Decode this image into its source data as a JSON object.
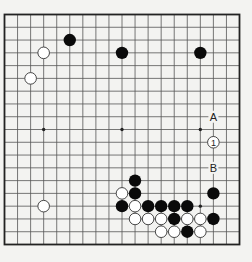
{
  "diagram": {
    "type": "go-board",
    "size": 19,
    "colors": {
      "background": "#f3f3f1",
      "line": "#555555",
      "border": "#222222",
      "black": "#0a0a0a",
      "white": "#ffffff",
      "white_outline": "#333333",
      "label": "#222222"
    },
    "star_points": [
      [
        3,
        9
      ],
      [
        9,
        9
      ],
      [
        15,
        9
      ],
      [
        15,
        15
      ]
    ],
    "stones": [
      {
        "color": "black",
        "col": 5,
        "row": 2
      },
      {
        "color": "white",
        "col": 3,
        "row": 3
      },
      {
        "color": "black",
        "col": 9,
        "row": 3
      },
      {
        "color": "black",
        "col": 15,
        "row": 3
      },
      {
        "color": "white",
        "col": 2,
        "row": 5
      },
      {
        "color": "white",
        "col": 3,
        "row": 15
      },
      {
        "color": "black",
        "col": 10,
        "row": 13
      },
      {
        "color": "white",
        "col": 9,
        "row": 14
      },
      {
        "color": "black",
        "col": 10,
        "row": 14
      },
      {
        "color": "black",
        "col": 16,
        "row": 14
      },
      {
        "color": "black",
        "col": 9,
        "row": 15
      },
      {
        "color": "white",
        "col": 10,
        "row": 15
      },
      {
        "color": "black",
        "col": 11,
        "row": 15
      },
      {
        "color": "black",
        "col": 12,
        "row": 15
      },
      {
        "color": "black",
        "col": 13,
        "row": 15
      },
      {
        "color": "black",
        "col": 14,
        "row": 15
      },
      {
        "color": "white",
        "col": 10,
        "row": 16
      },
      {
        "color": "white",
        "col": 11,
        "row": 16
      },
      {
        "color": "white",
        "col": 12,
        "row": 16
      },
      {
        "color": "black",
        "col": 13,
        "row": 16
      },
      {
        "color": "white",
        "col": 14,
        "row": 16
      },
      {
        "color": "white",
        "col": 15,
        "row": 16
      },
      {
        "color": "black",
        "col": 16,
        "row": 16
      },
      {
        "color": "white",
        "col": 12,
        "row": 17
      },
      {
        "color": "white",
        "col": 13,
        "row": 17
      },
      {
        "color": "black",
        "col": 14,
        "row": 17
      },
      {
        "color": "white",
        "col": 15,
        "row": 17
      },
      {
        "color": "white",
        "col": 16,
        "row": 10,
        "label": "1"
      }
    ],
    "letter_labels": [
      {
        "text": "A",
        "col": 16,
        "row": 8
      },
      {
        "text": "B",
        "col": 16,
        "row": 12
      }
    ]
  }
}
